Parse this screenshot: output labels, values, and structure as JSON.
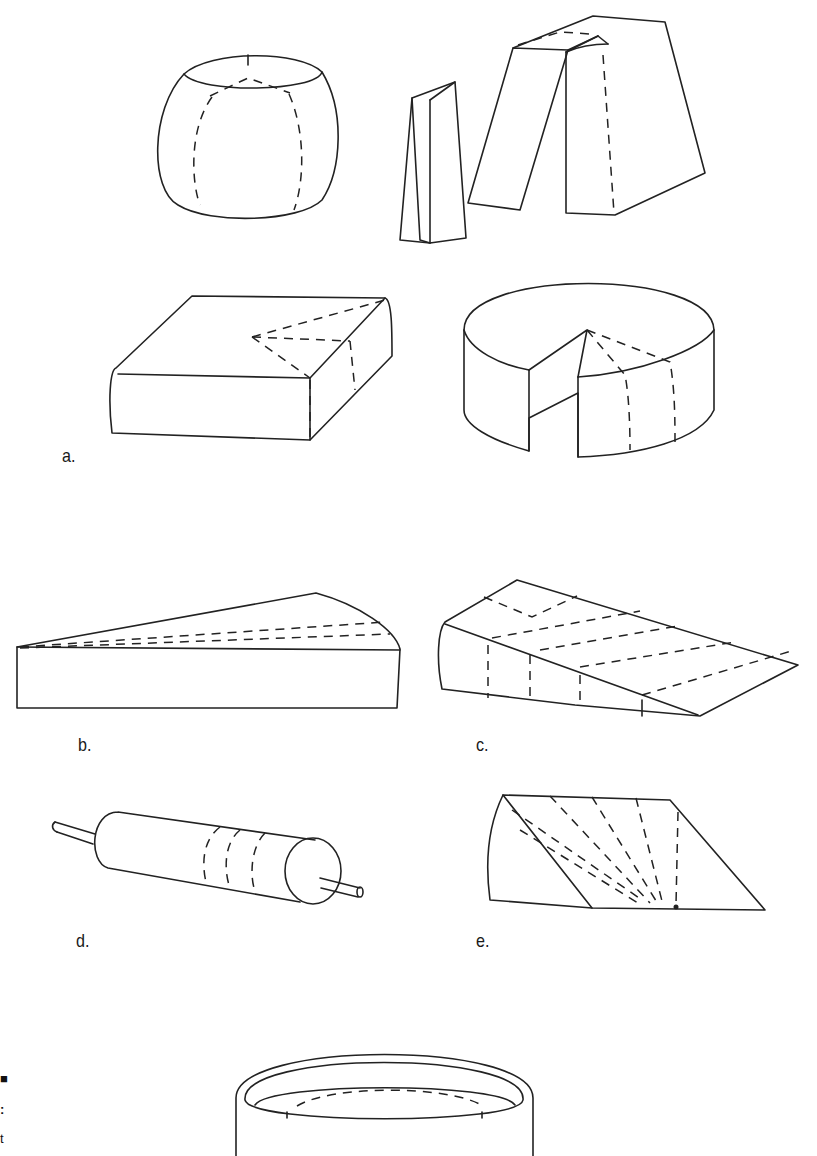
{
  "figure": {
    "type": "illustration",
    "stroke_color": "#222222",
    "background": "#ffffff",
    "panels": [
      {
        "id": "a",
        "label": "a.",
        "shapes": [
          "round-ball",
          "tall-wedge-blocks",
          "square-block",
          "wheel-with-slice-removed"
        ]
      },
      {
        "id": "b",
        "label": "b.",
        "shapes": [
          "long-thin-wedge"
        ]
      },
      {
        "id": "c",
        "label": "c.",
        "shapes": [
          "sloped-wedge"
        ]
      },
      {
        "id": "d",
        "label": "d.",
        "shapes": [
          "log-cylinder-with-rods"
        ]
      },
      {
        "id": "e",
        "label": "e.",
        "shapes": [
          "angled-wedge-radial-cuts"
        ]
      },
      {
        "id": "f",
        "label": "",
        "shapes": [
          "drum-cylinder"
        ]
      }
    ]
  },
  "labels": {
    "a": "a.",
    "b": "b.",
    "c": "c.",
    "d": "d.",
    "e": "e."
  },
  "margin_fragments": [
    "■",
    ":",
    "t"
  ]
}
